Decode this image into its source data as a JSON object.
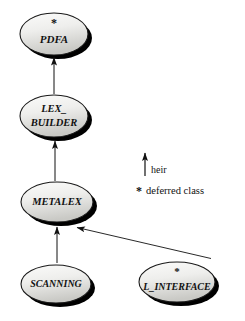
{
  "diagram": {
    "type": "class-inheritance-diagram",
    "width": 245,
    "height": 321,
    "background_color": "#ffffff",
    "line_color": "#111111",
    "node_fill_top": "#f4f4f2",
    "node_fill_bottom": "#cfcfcb",
    "node_stroke": "#1a1a1a",
    "shadow_color": "#000000",
    "deferred_marker": "*",
    "nodes": [
      {
        "id": "pdfa",
        "label_line1": "PDFA",
        "label_line2": "",
        "deferred": true,
        "star": "*",
        "cx": 54,
        "cy": 34,
        "rx": 34,
        "ry": 21
      },
      {
        "id": "lex_builder",
        "label_line1": "LEX_",
        "label_line2": "BUILDER",
        "deferred": false,
        "star": "",
        "cx": 54,
        "cy": 116,
        "rx": 34,
        "ry": 21
      },
      {
        "id": "metalex",
        "label_line1": "METALEX",
        "label_line2": "",
        "deferred": false,
        "star": "",
        "cx": 57,
        "cy": 202,
        "rx": 36,
        "ry": 20
      },
      {
        "id": "scanning",
        "label_line1": "SCANNING",
        "label_line2": "",
        "deferred": false,
        "star": "",
        "cx": 56,
        "cy": 284,
        "rx": 35,
        "ry": 19
      },
      {
        "id": "l_interface",
        "label_line1": "L_INTERFACE",
        "label_line2": "",
        "deferred": true,
        "star": "*",
        "cx": 177,
        "cy": 282,
        "rx": 38,
        "ry": 20
      }
    ],
    "edges": [
      {
        "id": "lex_builder-to-pdfa",
        "relation": "heir",
        "from": "lex_builder",
        "to": "pdfa",
        "x1": 54,
        "y1": 94,
        "x2": 54,
        "y2": 57
      },
      {
        "id": "metalex-to-lex_builder",
        "relation": "heir",
        "from": "metalex",
        "to": "lex_builder",
        "x1": 55,
        "y1": 181,
        "x2": 55,
        "y2": 140
      },
      {
        "id": "scanning-to-metalex",
        "relation": "heir",
        "from": "scanning",
        "to": "metalex",
        "x1": 57,
        "y1": 263,
        "x2": 57,
        "y2": 226
      },
      {
        "id": "l_interface-to-metalex",
        "relation": "heir",
        "from": "l_interface",
        "to": "metalex",
        "x1": 211,
        "y1": 258,
        "x2": 75,
        "y2": 227
      }
    ]
  },
  "legend": {
    "arrow_entry_label": "heir",
    "star_entry_symbol": "*",
    "star_entry_label": "deferred class",
    "arrow": {
      "x": 145,
      "y_top": 152,
      "y_bottom": 176
    },
    "arrow_label_x": 151,
    "arrow_label_y": 171,
    "star_x": 137,
    "star_y": 191,
    "star_label_x": 146,
    "star_label_y": 191
  }
}
